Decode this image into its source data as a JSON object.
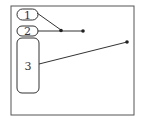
{
  "diagram": {
    "stroke_color": "#333333",
    "labels": [
      {
        "id": "1",
        "text": "1"
      },
      {
        "id": "2",
        "text": "2"
      },
      {
        "id": "3",
        "text": "3"
      }
    ],
    "leader_lines": [
      {
        "from_label": "1",
        "to_point": [
          61,
          30
        ]
      },
      {
        "from_label": "2",
        "to_point": [
          83,
          31
        ]
      },
      {
        "from_label": "3",
        "to_point": [
          127,
          42
        ]
      }
    ]
  }
}
